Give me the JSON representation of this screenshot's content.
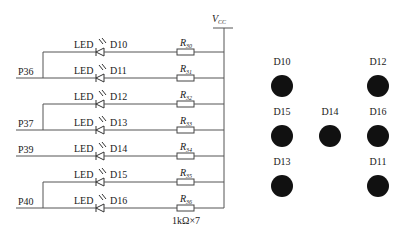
{
  "schematic": {
    "supply_label": "V",
    "supply_sub": "CC",
    "led_label": "LED",
    "resistor_note": "1kΩ×7",
    "rows": [
      {
        "diode": "D10",
        "resistor": "R",
        "resistor_sub": "30",
        "y": 52
      },
      {
        "diode": "D11",
        "resistor": "R",
        "resistor_sub": "31",
        "y": 78
      },
      {
        "diode": "D12",
        "resistor": "R",
        "resistor_sub": "32",
        "y": 104
      },
      {
        "diode": "D13",
        "resistor": "R",
        "resistor_sub": "33",
        "y": 130
      },
      {
        "diode": "D14",
        "resistor": "R",
        "resistor_sub": "34",
        "y": 156
      },
      {
        "diode": "D15",
        "resistor": "R",
        "resistor_sub": "35",
        "y": 182
      },
      {
        "diode": "D16",
        "resistor": "R",
        "resistor_sub": "36",
        "y": 208
      }
    ],
    "ports": [
      {
        "label": "P36",
        "y": 78,
        "branch_top": 52
      },
      {
        "label": "P37",
        "y": 130,
        "branch_top": 104
      },
      {
        "label": "P39",
        "y": 156,
        "branch_top": 156
      },
      {
        "label": "P40",
        "y": 208,
        "branch_top": 182
      }
    ]
  },
  "layout_panel": {
    "leds": [
      {
        "label": "D10",
        "cx": 282,
        "cy": 86
      },
      {
        "label": "D12",
        "cx": 378,
        "cy": 86
      },
      {
        "label": "D15",
        "cx": 282,
        "cy": 136
      },
      {
        "label": "D14",
        "cx": 330,
        "cy": 136
      },
      {
        "label": "D16",
        "cx": 378,
        "cy": 136
      },
      {
        "label": "D13",
        "cx": 282,
        "cy": 186
      },
      {
        "label": "D11",
        "cx": 378,
        "cy": 186
      }
    ]
  }
}
